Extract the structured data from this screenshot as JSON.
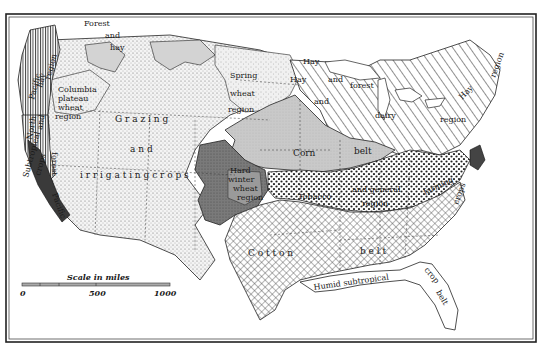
{
  "map": {
    "type": "agricultural-regions-map",
    "subject": "Agricultural regions of the United States",
    "colors": {
      "background": "#ffffff",
      "ink": "#1a1a1a",
      "light_gray": "#d4d4d4",
      "mid_gray": "#b8b8b8",
      "dark_gray": "#6a6a6a",
      "stipple": "#efefef"
    },
    "regions": [
      {
        "id": "grazing",
        "label_words": [
          "Grazing",
          "and",
          "irrigating",
          "crops"
        ],
        "pattern": "fine-stipple"
      },
      {
        "id": "columbia",
        "label_words": [
          "Columbia",
          "plateau",
          "wheat",
          "region"
        ],
        "pattern": "stipple"
      },
      {
        "id": "pacific-hay",
        "label_words": [
          "Pacific",
          "hay",
          "region"
        ],
        "pattern": "vertical-lines"
      },
      {
        "id": "north-forest",
        "label_words": [
          "North",
          "and",
          "forest"
        ],
        "pattern": "vertical-lines"
      },
      {
        "id": "forest-hay-nw",
        "label_words": [
          "Forest",
          "and",
          "hay"
        ],
        "pattern": "light-gray"
      },
      {
        "id": "spring-wheat",
        "label_words": [
          "Spring",
          "wheat",
          "region"
        ],
        "pattern": "light-stipple"
      },
      {
        "id": "hay-forest",
        "label_words": [
          "Hay",
          "and",
          "forest"
        ],
        "pattern": "diagonal-hatch"
      },
      {
        "id": "hay-dairy",
        "label_words": [
          "Hay",
          "and",
          "dairy",
          "region"
        ],
        "pattern": "diagonal-hatch"
      },
      {
        "id": "hay-region-ne",
        "label_words": [
          "Hay",
          "region"
        ],
        "pattern": "diagonal-hatch"
      },
      {
        "id": "corn-belt",
        "label_words": [
          "Corn",
          "belt"
        ],
        "pattern": "gray"
      },
      {
        "id": "hard-winter-wheat",
        "label_words": [
          "Hard",
          "winter",
          "wheat",
          "region"
        ],
        "pattern": "dark-gray"
      },
      {
        "id": "tobacco-general",
        "label_words": [
          "Tobacco",
          "and general",
          "farming",
          "region"
        ],
        "pattern": "dots"
      },
      {
        "id": "truck-crops",
        "label_words": [
          "crops"
        ],
        "pattern": "dark"
      },
      {
        "id": "cotton-belt",
        "label_words": [
          "Cotton",
          "belt"
        ],
        "pattern": "cross-hatch"
      },
      {
        "id": "humid-subtropical",
        "label_words": [
          "Humid subtropical",
          "crop",
          "belt"
        ],
        "pattern": "white"
      },
      {
        "id": "subtropical-crops",
        "label_words": [
          "Subtropical",
          "crops"
        ],
        "pattern": "dark"
      },
      {
        "id": "pacific",
        "label_words": [
          "Pacific"
        ],
        "pattern": "dark"
      }
    ],
    "labels": {
      "grazing_1": "G r a z i n g",
      "grazing_2": "a n d",
      "grazing_3": "i r r i g a t i n g   c r o p s",
      "columbia_1": "Columbia",
      "columbia_2": "plateau",
      "columbia_3": "wheat",
      "columbia_4": "region",
      "pacific_hay_1": "Pacific",
      "pacific_hay_2": "hay",
      "pacific_hay_3": "region",
      "north_1": "North",
      "north_2": "and",
      "forest_v": "forest",
      "forest_nw_1": "Forest",
      "forest_nw_2": "and",
      "forest_nw_3": "hay",
      "spring_1": "Spring",
      "spring_2": "wheat",
      "spring_3": "region",
      "hay_lake_1": "Hay",
      "hay_lake_2": "and",
      "hay_lake_3": "forest",
      "hay_dairy_1": "Hay",
      "hay_dairy_2": "and",
      "hay_dairy_3": "dairy",
      "hay_dairy_4": "region",
      "hay_ne_1": "Hay",
      "hay_ne_2": "region",
      "corn": "Corn",
      "belt_corn": "belt",
      "hard_1": "Hard",
      "hard_2": "winter",
      "hard_3": "wheat",
      "hard_4": "region",
      "tobacco": "Tobacco",
      "general": "and general",
      "farming": "farming",
      "gen_region": "region",
      "crops_east": "crops",
      "cotton": "C o t t o n",
      "belt_cotton": "b e l t",
      "humid": "Humid subtropical",
      "crop_fl": "crop",
      "belt_fl": "belt",
      "subtropical": "Subtropical",
      "crops_ca": "crops",
      "pacific_sw": "Pacific"
    },
    "scale_bar": {
      "title": "Scale in miles",
      "ticks": [
        "0",
        "500",
        "1000"
      ]
    }
  }
}
